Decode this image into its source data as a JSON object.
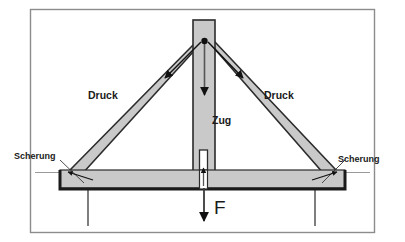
{
  "diagram": {
    "labels": {
      "compression_left": "Druck",
      "compression_right": "Druck",
      "tension_center": "Zug",
      "shear_left": "Scherung",
      "shear_right": "Scherung",
      "force": "F"
    },
    "colors": {
      "member_fill": "#c9c9c9",
      "member_stroke": "#2b2b2b",
      "beam_edge": "#1a1a1a",
      "frame_border": "#8c8c8c",
      "background": "#ffffff",
      "text": "#1a1a1a",
      "guide_line": "#9a9a9a"
    },
    "members": [
      {
        "name": "rafter-left",
        "force_type": "Druck",
        "arrow_direction": "down-left"
      },
      {
        "name": "rafter-right",
        "force_type": "Druck",
        "arrow_direction": "down-right"
      },
      {
        "name": "king-post",
        "force_type": "Zug",
        "arrow_direction": "down"
      },
      {
        "name": "tie-beam",
        "force_type": "",
        "arrow_direction": ""
      },
      {
        "name": "joint-left",
        "force_type": "Scherung",
        "arrow_direction": ""
      },
      {
        "name": "joint-right",
        "force_type": "Scherung",
        "arrow_direction": ""
      },
      {
        "name": "applied-load",
        "force_type": "F",
        "arrow_direction": "down"
      }
    ]
  }
}
